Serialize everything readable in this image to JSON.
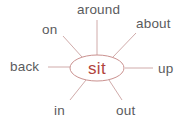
{
  "diagram": {
    "type": "word-web",
    "center_word": "sit",
    "satellite_words": {
      "top": "around",
      "top_left": "on",
      "top_right": "about",
      "left": "back",
      "right": "up",
      "bottom_left": "in",
      "bottom_right": "out"
    },
    "colors": {
      "background": "#ffffff",
      "label_text": "#5a5b5d",
      "center_text": "#b2453e",
      "ellipse_stroke": "#ca918f",
      "connector_line": "#d0abaa"
    }
  }
}
